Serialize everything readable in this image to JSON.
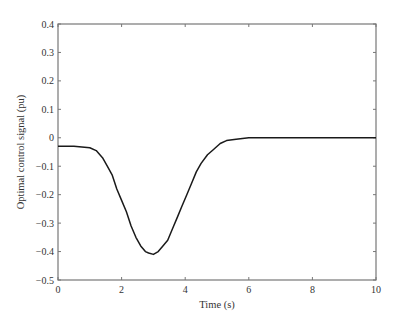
{
  "chart_data": {
    "type": "line",
    "title": "",
    "xlabel": "Time (s)",
    "ylabel": "Optimal control signal (pu)",
    "xlim": [
      0,
      10
    ],
    "ylim": [
      -0.5,
      0.4
    ],
    "xticks": [
      "0",
      "2",
      "4",
      "6",
      "8",
      "10"
    ],
    "yticks": [
      "0.4",
      "0.3",
      "0.2",
      "0.1",
      "0",
      "−0.1",
      "−0.2",
      "−0.3",
      "−0.4",
      "−0.5"
    ],
    "grid": false,
    "legend": null,
    "series": [
      {
        "name": "Optimal control signal",
        "color": "#1a1a1a",
        "x": [
          0,
          0.5,
          1.0,
          1.2,
          1.4,
          1.55,
          1.7,
          1.85,
          2.0,
          2.15,
          2.3,
          2.45,
          2.6,
          2.75,
          2.85,
          3.0,
          3.15,
          3.3,
          3.45,
          3.6,
          3.75,
          3.9,
          4.05,
          4.2,
          4.35,
          4.5,
          4.7,
          4.9,
          5.1,
          5.3,
          5.6,
          6.0,
          7.0,
          8.0,
          9.0,
          10.0
        ],
        "y": [
          -0.03,
          -0.03,
          -0.035,
          -0.045,
          -0.07,
          -0.1,
          -0.13,
          -0.18,
          -0.22,
          -0.26,
          -0.31,
          -0.35,
          -0.38,
          -0.4,
          -0.405,
          -0.41,
          -0.4,
          -0.38,
          -0.36,
          -0.32,
          -0.28,
          -0.24,
          -0.2,
          -0.16,
          -0.12,
          -0.09,
          -0.06,
          -0.04,
          -0.02,
          -0.01,
          -0.005,
          0.0,
          0.0,
          0.0,
          0.0,
          0.0
        ]
      }
    ]
  }
}
